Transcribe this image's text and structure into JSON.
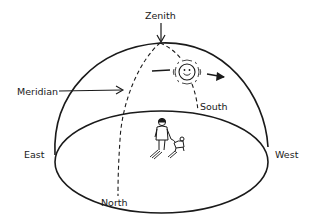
{
  "diagram": {
    "labels": {
      "zenith": "Zenith",
      "meridian": "Meridian",
      "south": "South",
      "east": "East",
      "west": "West",
      "north": "North"
    },
    "elements": {
      "dome": "hemisphere-outline",
      "horizon": "horizon-ellipse",
      "meridian_line": "dashed-meridian-arc",
      "sun": "smiling-sun-icon",
      "sun_motion": "arrow-left-to-right",
      "observer": "person-walking-dog"
    },
    "colors": {
      "ink": "#1a1a1a",
      "background": "#ffffff"
    }
  }
}
